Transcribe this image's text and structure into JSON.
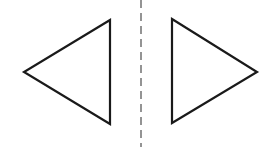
{
  "diagram": {
    "colors": {
      "background": "#ffffff",
      "stroke": "#1a1a1a",
      "axis": "#7a7a7a"
    },
    "axis": {
      "x": 141,
      "y1": 0,
      "y2": 147,
      "dash": "8 5",
      "stroke_width": 1.6
    },
    "left_triangle": {
      "points": "110,20 24,72 110,124",
      "orientation": "pointing-left"
    },
    "right_triangle": {
      "points": "172,19 257,72 172,123",
      "orientation": "pointing-right"
    },
    "stroke_width": 2.2,
    "label": "Reflection symmetry"
  }
}
